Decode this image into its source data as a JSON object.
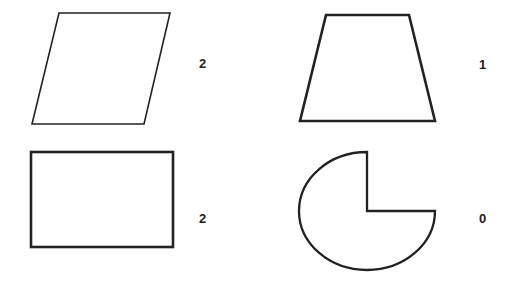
{
  "shapes": [
    {
      "name": "parallelogram",
      "label": "2",
      "stroke": "#222222"
    },
    {
      "name": "trapezoid",
      "label": "1",
      "stroke": "#222222"
    },
    {
      "name": "rectangle",
      "label": "2",
      "stroke": "#222222"
    },
    {
      "name": "three-quarter-circle",
      "label": "0",
      "stroke": "#222222"
    }
  ],
  "colors": {
    "background": "#ffffff",
    "stroke": "#222222",
    "text": "#222222"
  }
}
